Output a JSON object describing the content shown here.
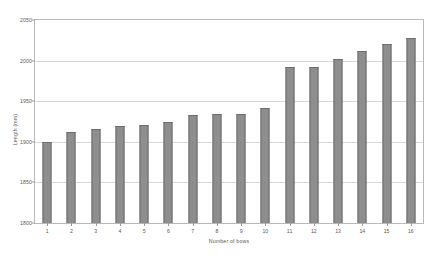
{
  "chart_data": {
    "type": "bar",
    "title": "",
    "xlabel": "Number of bows",
    "ylabel": "Length (mm)",
    "categories": [
      "1",
      "2",
      "3",
      "4",
      "5",
      "6",
      "7",
      "8",
      "9",
      "10",
      "11",
      "12",
      "13",
      "14",
      "15",
      "16"
    ],
    "values": [
      1900,
      1912,
      1916,
      1919,
      1921,
      1925,
      1933,
      1934,
      1934,
      1942,
      1992,
      1992,
      2002,
      2012,
      2020,
      2028
    ],
    "ylim": [
      1800,
      2050
    ],
    "yticks": [
      1800,
      1850,
      1900,
      1950,
      2000,
      2050
    ],
    "ytick_labels": [
      "1800",
      "1850",
      "1900",
      "1950",
      "2000",
      "2050"
    ],
    "grid": true,
    "legend": false,
    "colors": {
      "bar_fill": "#8e8e8e",
      "bar_edge": "#6d6d6d",
      "gridline": "#d8d8d8",
      "axis": "#b9b9b9",
      "text": "#5a5a5a",
      "background": "#ffffff"
    }
  }
}
